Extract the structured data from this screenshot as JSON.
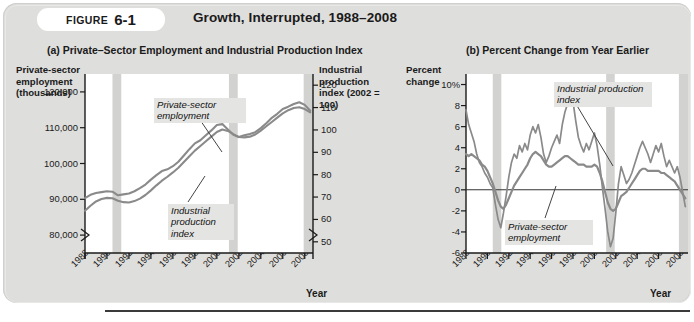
{
  "figure": {
    "badge_word": "FIGURE",
    "badge_number": "6-1",
    "title": "Growth, Interrupted, 1988–2008",
    "panel_a_title": "(a) Private–Sector Employment and Industrial Production Index",
    "panel_b_title": "(b) Percent Change from Year Earlier",
    "background": "#dededc",
    "line_color": "#8a8a8a",
    "recession_band_color": "#d2d2d0",
    "axis_color": "#1a1a1a"
  },
  "panel_a": {
    "y_axis_left_title": "Private-sector employment (thousands)",
    "y_axis_right_title": "Industrial production index (2002 = 100)",
    "x_axis_title": "Year",
    "y_left_ticks": [
      "120,000",
      "110,000",
      "100,000",
      "90,000",
      "80,000"
    ],
    "y_right_ticks": [
      "120",
      "110",
      "100",
      "90",
      "80",
      "70",
      "60",
      "50"
    ],
    "x_ticks": [
      "1988",
      "1990",
      "1992",
      "1994",
      "1996",
      "1998",
      "2000",
      "2002",
      "2004",
      "2006",
      "2008"
    ],
    "annotation_employment": "Private-sector employment",
    "annotation_ipi": "Industrial production index",
    "axis_break": true
  },
  "panel_b": {
    "y_axis_title": "Percent change",
    "x_axis_title": "Year",
    "y_ticks": [
      "10%",
      "8",
      "6",
      "4",
      "2",
      "0",
      "-2",
      "-4",
      "-6"
    ],
    "x_ticks": [
      "1988",
      "1990",
      "1992",
      "1994",
      "1996",
      "1998",
      "2000",
      "2002",
      "2004",
      "2006",
      "2008"
    ],
    "annotation_employment": "Private-sector employment",
    "annotation_ipi": "Industrial production index",
    "zero_line": true
  },
  "chart_data": [
    {
      "type": "line",
      "id": "panel-a",
      "title": "(a) Private–Sector Employment and Industrial Production Index",
      "xlabel": "Year",
      "ylabel": "Private-sector employment (thousands)",
      "ylabel_right": "Industrial production index (2002 = 100)",
      "xlim": [
        1988,
        2008.75
      ],
      "ylim": [
        75000,
        125000
      ],
      "ylim_right": [
        45,
        125
      ],
      "grid": false,
      "legend": "inline-annotations",
      "recession_bands": [
        [
          1990.5,
          1991.3
        ],
        [
          2001.1,
          2001.9
        ],
        [
          2007.9,
          2008.75
        ]
      ],
      "x": [
        1988,
        1988.5,
        1989,
        1989.5,
        1990,
        1990.5,
        1991,
        1991.5,
        1992,
        1992.5,
        1993,
        1993.5,
        1994,
        1994.5,
        1995,
        1995.5,
        1996,
        1996.5,
        1997,
        1997.5,
        1998,
        1998.5,
        1999,
        1999.5,
        2000,
        2000.5,
        2001,
        2001.5,
        2002,
        2002.5,
        2003,
        2003.5,
        2004,
        2004.5,
        2005,
        2005.5,
        2006,
        2006.5,
        2007,
        2007.5,
        2008,
        2008.5
      ],
      "series": [
        {
          "name": "Private-sector employment",
          "axis": "left",
          "units": "thousands",
          "values": [
            86800,
            88200,
            89400,
            90100,
            90400,
            90300,
            89600,
            89200,
            89100,
            89500,
            90200,
            91200,
            92500,
            93900,
            95200,
            96300,
            97500,
            98800,
            100400,
            102000,
            103600,
            104900,
            106200,
            107500,
            108800,
            109500,
            109100,
            108200,
            107400,
            107300,
            107500,
            108100,
            109200,
            110400,
            111600,
            112800,
            114000,
            114900,
            115500,
            115700,
            115200,
            114300
          ]
        },
        {
          "name": "Industrial production index",
          "axis": "right",
          "units": "index (2002 = 100)",
          "values": [
            69.5,
            71.0,
            71.8,
            72.2,
            72.6,
            72.4,
            70.8,
            71.2,
            71.6,
            72.6,
            74.0,
            75.6,
            77.8,
            79.8,
            81.6,
            82.4,
            83.8,
            85.8,
            88.6,
            91.4,
            94.0,
            95.4,
            97.6,
            99.8,
            102.2,
            102.6,
            100.2,
            97.8,
            96.8,
            97.6,
            98.2,
            99.0,
            100.8,
            103.0,
            105.4,
            107.2,
            109.4,
            110.4,
            111.6,
            112.4,
            111.2,
            108.6
          ]
        }
      ]
    },
    {
      "type": "line",
      "id": "panel-b",
      "title": "(b) Percent Change from Year Earlier",
      "xlabel": "Year",
      "ylabel": "Percent change",
      "xlim": [
        1988,
        2008.75
      ],
      "ylim": [
        -6,
        11
      ],
      "grid": false,
      "zero_line": true,
      "legend": "inline-annotations",
      "recession_bands": [
        [
          1990.5,
          1991.3
        ],
        [
          2001.1,
          2001.9
        ],
        [
          2007.9,
          2008.75
        ]
      ],
      "x": [
        1988,
        1988.25,
        1988.5,
        1988.75,
        1989,
        1989.25,
        1989.5,
        1989.75,
        1990,
        1990.25,
        1990.5,
        1990.75,
        1991,
        1991.25,
        1991.5,
        1991.75,
        1992,
        1992.25,
        1992.5,
        1992.75,
        1993,
        1993.25,
        1993.5,
        1993.75,
        1994,
        1994.25,
        1994.5,
        1994.75,
        1995,
        1995.25,
        1995.5,
        1995.75,
        1996,
        1996.25,
        1996.5,
        1996.75,
        1997,
        1997.25,
        1997.5,
        1997.75,
        1998,
        1998.25,
        1998.5,
        1998.75,
        1999,
        1999.25,
        1999.5,
        1999.75,
        2000,
        2000.25,
        2000.5,
        2000.75,
        2001,
        2001.25,
        2001.5,
        2001.75,
        2002,
        2002.25,
        2002.5,
        2002.75,
        2003,
        2003.25,
        2003.5,
        2003.75,
        2004,
        2004.25,
        2004.5,
        2004.75,
        2005,
        2005.25,
        2005.5,
        2005.75,
        2006,
        2006.25,
        2006.5,
        2006.75,
        2007,
        2007.25,
        2007.5,
        2007.75,
        2008,
        2008.5
      ],
      "series": [
        {
          "name": "Industrial production index",
          "units": "percent change from year earlier",
          "values": [
            7.6,
            6.2,
            5.4,
            4.6,
            3.4,
            2.6,
            2.2,
            1.6,
            1.2,
            0.6,
            0.2,
            -1.4,
            -2.8,
            -3.6,
            -2.2,
            -0.6,
            1.2,
            2.6,
            3.4,
            3.0,
            4.2,
            3.6,
            4.4,
            3.8,
            5.2,
            6.0,
            5.4,
            6.2,
            5.0,
            3.4,
            2.6,
            3.2,
            4.0,
            4.6,
            5.2,
            4.4,
            6.2,
            7.4,
            8.2,
            9.6,
            8.4,
            6.6,
            5.0,
            4.2,
            3.6,
            4.4,
            3.8,
            4.6,
            5.4,
            4.2,
            2.4,
            0.2,
            -1.8,
            -4.0,
            -5.4,
            -4.6,
            -2.2,
            0.6,
            2.2,
            1.4,
            0.6,
            1.0,
            1.6,
            2.4,
            3.2,
            4.0,
            4.6,
            4.0,
            3.4,
            2.6,
            3.4,
            4.2,
            3.6,
            4.4,
            3.2,
            2.2,
            2.8,
            2.2,
            1.6,
            2.2,
            1.2,
            -1.6
          ]
        },
        {
          "name": "Private-sector employment",
          "units": "percent change from year earlier",
          "values": [
            3.4,
            3.2,
            3.4,
            3.2,
            3.0,
            2.8,
            2.4,
            2.2,
            1.8,
            1.2,
            0.6,
            -0.2,
            -1.0,
            -1.6,
            -1.8,
            -1.4,
            -0.8,
            -0.2,
            0.4,
            0.8,
            1.2,
            1.6,
            2.0,
            2.4,
            3.0,
            3.4,
            3.6,
            3.4,
            3.2,
            2.8,
            2.4,
            2.2,
            2.2,
            2.4,
            2.6,
            2.8,
            3.0,
            3.2,
            3.2,
            3.0,
            2.8,
            2.6,
            2.4,
            2.4,
            2.4,
            2.2,
            2.2,
            2.2,
            2.4,
            2.2,
            1.6,
            0.8,
            -0.2,
            -1.2,
            -1.8,
            -2.0,
            -1.8,
            -1.2,
            -0.6,
            -0.4,
            -0.2,
            0.2,
            0.6,
            1.0,
            1.4,
            1.8,
            2.0,
            2.0,
            1.8,
            1.8,
            1.8,
            1.8,
            1.8,
            1.6,
            1.6,
            1.4,
            1.2,
            1.0,
            0.8,
            0.4,
            0.0,
            -0.8
          ]
        }
      ]
    }
  ]
}
